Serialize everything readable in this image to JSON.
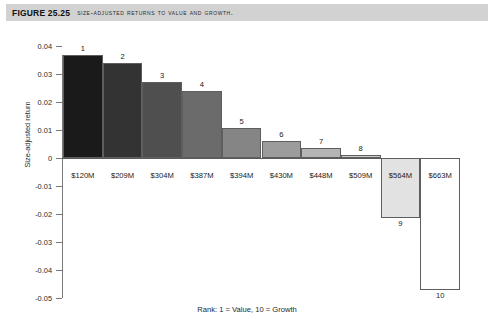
{
  "figure": {
    "number": "FIGURE 25.25",
    "title": "Size-adjusted returns to value and growth."
  },
  "caption": "Rank: 1 = Value, 10 = Growth",
  "chart_data": {
    "type": "bar",
    "title": "Size-adjusted returns to value and growth.",
    "xlabel": "Rank: 1 = Value, 10 = Growth",
    "ylabel": "Size-adjusted return",
    "ylim": [
      -0.05,
      0.04
    ],
    "ytick_labels": [
      "0.04",
      "0.03",
      "0.02",
      "0.01",
      "0",
      "-0.01",
      "-0.02",
      "-0.03",
      "-0.04",
      "-0.05"
    ],
    "ytick_values": [
      0.04,
      0.03,
      0.02,
      0.01,
      0,
      -0.01,
      -0.02,
      -0.03,
      -0.04,
      -0.05
    ],
    "grid": false,
    "legend": false,
    "categories": [
      "$120M",
      "$209M",
      "$304M",
      "$387M",
      "$394M",
      "$430M",
      "$448M",
      "$509M",
      "$564M",
      "$663M"
    ],
    "ranks": [
      "1",
      "2",
      "3",
      "4",
      "5",
      "6",
      "7",
      "8",
      "9",
      "10"
    ],
    "values": [
      0.0368,
      0.0338,
      0.0273,
      0.024,
      0.0107,
      0.006,
      0.0036,
      0.001,
      -0.0215,
      -0.047
    ],
    "bar_colors": [
      "#1a1a1a",
      "#333333",
      "#4f4f4f",
      "#6b6b6b",
      "#858585",
      "#9c9c9c",
      "#b5b5b5",
      "#cccccc",
      "#e2e2e2",
      "#ffffff"
    ],
    "bars": [
      {
        "rank": "1",
        "category": "$120M",
        "value": 0.0368,
        "color": "#1a1a1a"
      },
      {
        "rank": "2",
        "category": "$209M",
        "value": 0.0338,
        "color": "#333333"
      },
      {
        "rank": "3",
        "category": "$304M",
        "value": 0.0273,
        "color": "#4f4f4f"
      },
      {
        "rank": "4",
        "category": "$387M",
        "value": 0.024,
        "color": "#6b6b6b"
      },
      {
        "rank": "5",
        "category": "$394M",
        "value": 0.0107,
        "color": "#858585"
      },
      {
        "rank": "6",
        "category": "$430M",
        "value": 0.006,
        "color": "#9c9c9c"
      },
      {
        "rank": "7",
        "category": "$448M",
        "value": 0.0036,
        "color": "#b5b5b5"
      },
      {
        "rank": "8",
        "category": "$509M",
        "value": 0.001,
        "color": "#cccccc"
      },
      {
        "rank": "9",
        "category": "$564M",
        "value": -0.0215,
        "color": "#e2e2e2"
      },
      {
        "rank": "10",
        "category": "$663M",
        "value": -0.047,
        "color": "#ffffff"
      }
    ]
  }
}
